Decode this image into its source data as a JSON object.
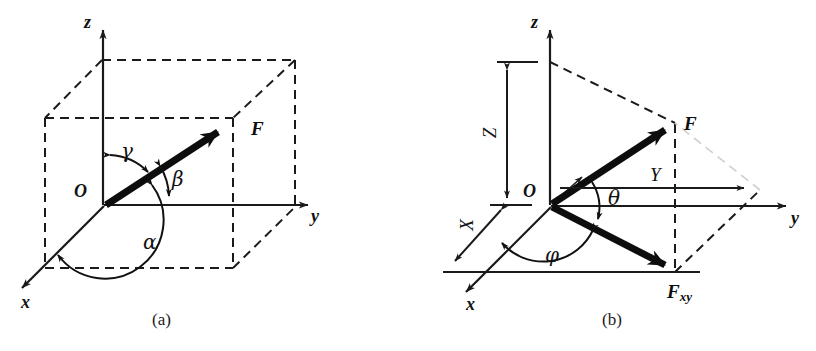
{
  "figure": {
    "background_color": "#ffffff",
    "line_color": "#1a1a1a",
    "vector_color": "#0d0d0d",
    "dashed_color": "#1a1a1a"
  },
  "panel_a": {
    "caption": "(a)",
    "origin_label": "O",
    "axes": [
      {
        "name": "z-axis",
        "label": "z"
      },
      {
        "name": "y-axis",
        "label": "y"
      },
      {
        "name": "x-axis",
        "label": "x"
      }
    ],
    "axis_z_label": "z",
    "axis_y_label": "y",
    "axis_x_label": "x",
    "vector_label": "F",
    "angles": [
      {
        "name": "alpha",
        "label": "α",
        "between": "x-axis and F"
      },
      {
        "name": "beta",
        "label": "β",
        "between": "y-axis and F"
      },
      {
        "name": "gamma",
        "label": "γ",
        "between": "z-axis and F"
      }
    ],
    "angle_alpha_label": "α",
    "angle_beta_label": "β",
    "angle_gamma_label": "γ"
  },
  "panel_b": {
    "caption": "(b)",
    "origin_label": "O",
    "axis_z_label": "z",
    "axis_y_label": "y",
    "axis_x_label": "x",
    "vector_label": "F",
    "projection_label_base": "F",
    "projection_label_sub": "xy",
    "components": [
      {
        "name": "X-component",
        "label": "X"
      },
      {
        "name": "Y-component",
        "label": "Y"
      },
      {
        "name": "Z-component",
        "label": "Z"
      }
    ],
    "component_x_label": "X",
    "component_y_label": "Y",
    "component_z_label": "Z",
    "angles": [
      {
        "name": "theta",
        "label": "θ",
        "between": "F and its xy-plane projection"
      },
      {
        "name": "phi",
        "label": "φ",
        "between": "x-axis and F_xy"
      }
    ],
    "angle_theta_label": "θ",
    "angle_phi_label": "φ"
  }
}
